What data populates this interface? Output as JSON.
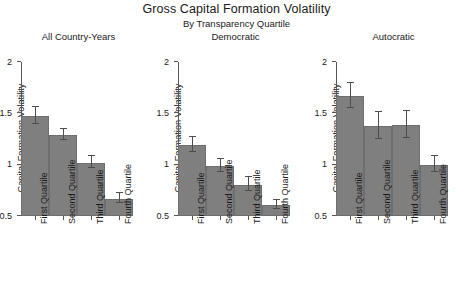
{
  "chart_data": {
    "type": "bar",
    "title": "Gross Capital Formation Volatility",
    "subtitle": "By Transparency Quartile",
    "ylabel": "Capital Formation Volatility",
    "xlabel": "",
    "ylim": [
      0.5,
      2
    ],
    "yticks": [
      0.5,
      1,
      1.5,
      2
    ],
    "ytick_labels": [
      "0.5",
      "1",
      "1.5",
      "2"
    ],
    "grid": false,
    "legend": "none",
    "categories": [
      "First Quartile",
      "Second Quartile",
      "Third Quartile",
      "Fourth Quartile"
    ],
    "panels": [
      {
        "title": "All Country-Years",
        "values": [
          1.47,
          1.29,
          1.02,
          0.67
        ],
        "err_low": [
          1.4,
          1.24,
          0.97,
          0.63
        ],
        "err_high": [
          1.56,
          1.35,
          1.08,
          0.72
        ]
      },
      {
        "title": "Democratic",
        "values": [
          1.19,
          0.99,
          0.8,
          0.61
        ],
        "err_low": [
          1.12,
          0.93,
          0.74,
          0.57
        ],
        "err_high": [
          1.27,
          1.06,
          0.88,
          0.66
        ]
      },
      {
        "title": "Autocratic",
        "values": [
          1.67,
          1.38,
          1.39,
          1.0
        ],
        "err_low": [
          1.55,
          1.25,
          1.26,
          0.93
        ],
        "err_high": [
          1.8,
          1.51,
          1.52,
          1.08
        ]
      }
    ]
  }
}
